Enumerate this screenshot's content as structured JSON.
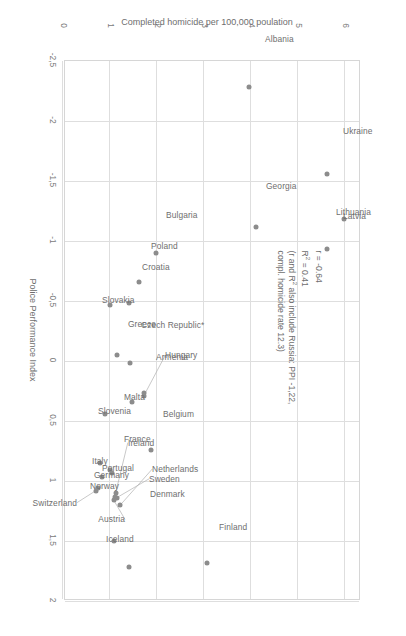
{
  "chart_data": {
    "type": "scatter",
    "title": "",
    "xlabel": "Police Performance Index",
    "ylabel": "Completed homicide per 100,000 poulation",
    "xlim": [
      -2.5,
      2.0
    ],
    "ylim": [
      0,
      6.3
    ],
    "xticks": [
      "-2,5",
      "-2",
      "-1,5",
      "-1",
      "-0,5",
      "0",
      "0,5",
      "1",
      "1,5",
      "2"
    ],
    "xtick_values": [
      -2.5,
      -2,
      -1.5,
      -1,
      -0.5,
      0,
      0.5,
      1,
      1.5,
      2
    ],
    "yticks": [
      "0",
      "1",
      "2",
      "3",
      "4",
      "5",
      "6"
    ],
    "ytick_values": [
      0,
      1,
      2,
      3,
      4,
      5,
      6
    ],
    "grid": true,
    "legend": "none",
    "point_color": "#8c8c8c",
    "grid_color": "#dedede",
    "annotation_lines": [
      "r = -0.64",
      "R² = 0.41",
      "(r and R² also include Russia: PPI -1,22,",
      "compl. homicide rate 12.3)"
    ],
    "points": [
      {
        "label": "Albania",
        "x": -2.28,
        "y": 3.95,
        "lx": -0.4,
        "ly": 0.34,
        "anchor": "end",
        "leader": false
      },
      {
        "label": "Ukraine",
        "x": -1.56,
        "y": 5.62,
        "lx": -0.36,
        "ly": 0.34,
        "anchor": "end",
        "leader": false
      },
      {
        "label": "Lithuania",
        "x": -1.18,
        "y": 5.98,
        "lx": -0.06,
        "ly": -0.18,
        "anchor": "end",
        "leader": false
      },
      {
        "label": "Georgia",
        "x": -1.12,
        "y": 4.1,
        "lx": -0.34,
        "ly": 0.22,
        "anchor": "end",
        "leader": false
      },
      {
        "label": "Latvia",
        "x": -0.93,
        "y": 5.62,
        "lx": -0.28,
        "ly": 0.34,
        "anchor": "end",
        "leader": false
      },
      {
        "label": "Bulgaria",
        "x": -0.9,
        "y": 1.98,
        "lx": -0.32,
        "ly": 0.22,
        "anchor": "end",
        "leader": false
      },
      {
        "label": "Poland",
        "x": -0.66,
        "y": 1.62,
        "lx": -0.3,
        "ly": 0.26,
        "anchor": "end",
        "leader": false
      },
      {
        "label": "Croatia",
        "x": -0.48,
        "y": 1.4,
        "lx": -0.3,
        "ly": 0.28,
        "anchor": "end",
        "leader": false
      },
      {
        "label": "Slovakia",
        "x": -0.47,
        "y": 1.0,
        "lx": -0.04,
        "ly": -0.16,
        "anchor": "end",
        "leader": false
      },
      {
        "label": "Greece",
        "x": -0.05,
        "y": 1.15,
        "lx": -0.26,
        "ly": 0.24,
        "anchor": "end",
        "leader": false
      },
      {
        "label": "Czech Republic*",
        "x": 0.02,
        "y": 1.42,
        "lx": -0.32,
        "ly": 0.24,
        "anchor": "end",
        "leader": false
      },
      {
        "label": "Armenia",
        "x": 0.27,
        "y": 1.72,
        "lx": -0.3,
        "ly": 0.26,
        "anchor": "end",
        "leader": false
      },
      {
        "label": "Hungary",
        "x": 0.29,
        "y": 1.72,
        "lx": -0.34,
        "ly": 0.46,
        "anchor": "end",
        "leader": true
      },
      {
        "label": "Malta",
        "x": 0.34,
        "y": 1.46,
        "lx": -0.04,
        "ly": -0.16,
        "anchor": "end",
        "leader": false
      },
      {
        "label": "Slovenia",
        "x": 0.44,
        "y": 0.9,
        "lx": -0.02,
        "ly": -0.16,
        "anchor": "end",
        "leader": false
      },
      {
        "label": "Belgium",
        "x": 0.74,
        "y": 1.88,
        "lx": -0.3,
        "ly": 0.24,
        "anchor": "end",
        "leader": false
      },
      {
        "label": "Portugal",
        "x": 0.91,
        "y": 1.0,
        "lx": -0.02,
        "ly": -0.16,
        "anchor": "end",
        "leader": false
      },
      {
        "label": "France",
        "x": 0.93,
        "y": 1.04,
        "lx": -0.28,
        "ly": 0.26,
        "anchor": "end",
        "leader": false
      },
      {
        "label": "Italy",
        "x": 0.85,
        "y": 0.78,
        "lx": -0.02,
        "ly": -0.16,
        "anchor": "end",
        "leader": false
      },
      {
        "label": "Germany",
        "x": 0.97,
        "y": 0.82,
        "lx": -0.02,
        "ly": -0.16,
        "anchor": "end",
        "leader": false
      },
      {
        "label": "Norway",
        "x": 1.06,
        "y": 0.74,
        "lx": -0.02,
        "ly": -0.16,
        "anchor": "end",
        "leader": false
      },
      {
        "label": "Switzerland",
        "x": 1.08,
        "y": 0.7,
        "lx": 0.1,
        "ly": -0.4,
        "anchor": "start",
        "leader": true
      },
      {
        "label": "Ireland",
        "x": 1.1,
        "y": 1.12,
        "lx": -0.42,
        "ly": 0.26,
        "anchor": "end",
        "leader": true
      },
      {
        "label": "Netherlands",
        "x": 1.2,
        "y": 1.22,
        "lx": -0.3,
        "ly": 0.68,
        "anchor": "end",
        "leader": true
      },
      {
        "label": "Sweden",
        "x": 1.14,
        "y": 1.14,
        "lx": -0.16,
        "ly": 0.7,
        "anchor": "end",
        "leader": true
      },
      {
        "label": "Denmark",
        "x": 1.13,
        "y": 1.11,
        "lx": -0.02,
        "ly": 0.74,
        "anchor": "end",
        "leader": false
      },
      {
        "label": "Austria",
        "x": 1.16,
        "y": 1.08,
        "lx": 0.16,
        "ly": 0.24,
        "anchor": "start",
        "leader": true
      },
      {
        "label": "Iceland",
        "x": 1.5,
        "y": 1.08,
        "lx": -0.02,
        "ly": -0.16,
        "anchor": "end",
        "leader": false
      },
      {
        "label": "Finland",
        "x": 1.68,
        "y": 3.07,
        "lx": -0.3,
        "ly": 0.24,
        "anchor": "end",
        "leader": false
      },
      {
        "label": "_unlabeled1",
        "x": 1.72,
        "y": 1.4,
        "lx": 0,
        "ly": 0,
        "anchor": "end",
        "leader": false,
        "hide_label": true
      }
    ]
  }
}
